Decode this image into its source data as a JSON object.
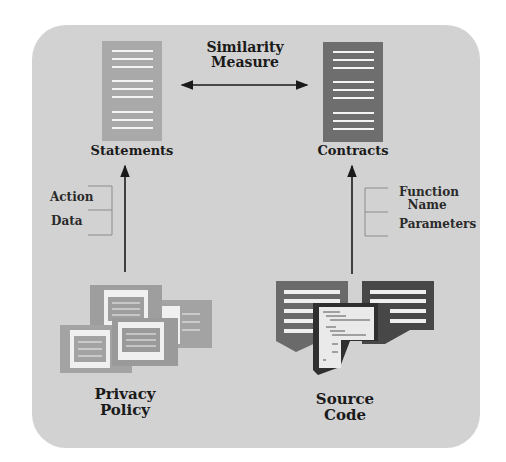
{
  "diagram": {
    "top_left_node": {
      "label": "Statements",
      "icon": "document-icon",
      "color": "#a9a9a9"
    },
    "top_right_node": {
      "label": "Contracts",
      "icon": "document-icon",
      "color": "#6e6e6e"
    },
    "relation": {
      "label_line1": "Similarity",
      "label_line2": "Measure",
      "arrow": "bidirectional"
    },
    "left_source": {
      "label_line1": "Privacy",
      "label_line2": "Policy",
      "icon": "policy-documents-icon"
    },
    "right_source": {
      "label_line1": "Source",
      "label_line2": "Code",
      "icon": "source-code-icon"
    },
    "left_fields": [
      "Action",
      "Data"
    ],
    "right_fields": {
      "field1_line1": "Function",
      "field1_line2": "Name",
      "field2": "Parameters"
    },
    "colors": {
      "panel": "#d2d2d2",
      "light_doc": "#a9a9a9",
      "dark_doc": "#6e6e6e",
      "darkest": "#4a4a4a"
    }
  }
}
